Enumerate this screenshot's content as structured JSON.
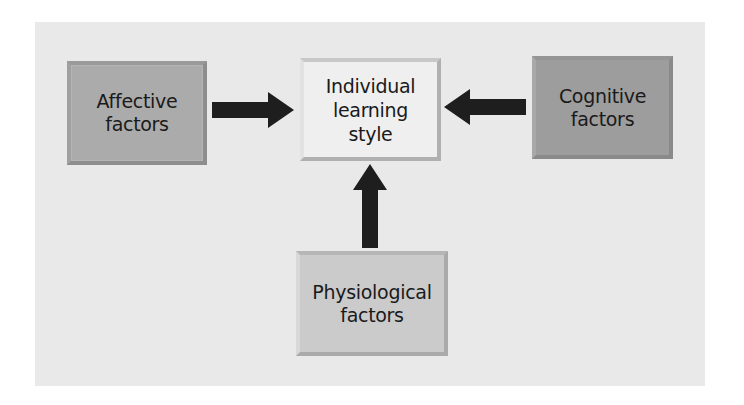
{
  "diagram": {
    "type": "flow",
    "colors": {
      "panel_background": "#e9e9e9",
      "affective_fill": "#ababab",
      "individual_fill": "#efefef",
      "cognitive_fill": "#9d9d9d",
      "physiological_fill": "#cbcbcb",
      "arrow": "#1e1e1e"
    },
    "nodes": {
      "affective": {
        "line1": "Affective",
        "line2": "factors"
      },
      "individual": {
        "line1": "Individual",
        "line2": "learning",
        "line3": "style"
      },
      "cognitive": {
        "line1": "Cognitive",
        "line2": "factors"
      },
      "physiological": {
        "line1": "Physiological",
        "line2": "factors"
      }
    },
    "edges": [
      {
        "from": "Affective factors",
        "to": "Individual learning style",
        "direction": "right"
      },
      {
        "from": "Cognitive factors",
        "to": "Individual learning style",
        "direction": "left"
      },
      {
        "from": "Physiological factors",
        "to": "Individual learning style",
        "direction": "up"
      }
    ]
  }
}
